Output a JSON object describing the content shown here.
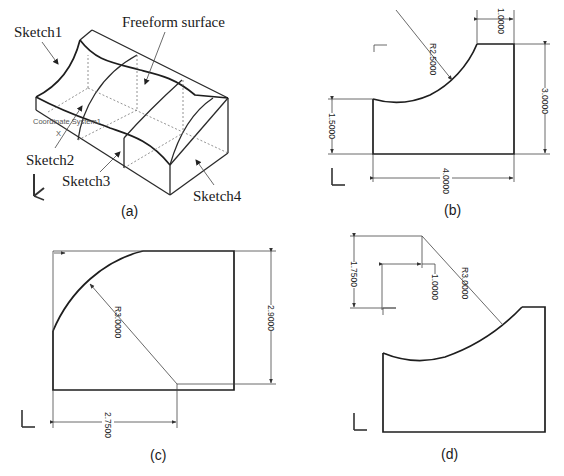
{
  "figure": {
    "panels": [
      {
        "id": "a",
        "caption": "(a)",
        "labels": {
          "sketch1": "Sketch1",
          "freeform": "Freeform surface",
          "sketch2": "Sketch2",
          "sketch3": "Sketch3",
          "sketch4": "Sketch4",
          "coord_system": "Coordinate System1",
          "axis_x": "X"
        }
      },
      {
        "id": "b",
        "caption": "(b)",
        "dimensions": {
          "radius": "R2.5000",
          "top_width": "1.0000",
          "right_height": "3.0000",
          "left_height": "1.5000",
          "bottom_width": "4.0000"
        }
      },
      {
        "id": "c",
        "caption": "(c)",
        "dimensions": {
          "radius": "R3.0000",
          "right_height": "2.9000",
          "bottom_width": "2.7500"
        }
      },
      {
        "id": "d",
        "caption": "(d)",
        "dimensions": {
          "radius": "R3.0000",
          "left_height": "1.7500",
          "offset": "1.0000"
        }
      }
    ],
    "axis_labels": {
      "z": "Z",
      "y": "Y",
      "x": "X"
    }
  }
}
